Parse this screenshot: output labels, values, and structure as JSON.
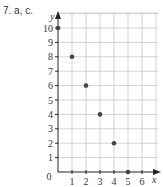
{
  "problem_label": "7. a, c.",
  "chart_data": {
    "type": "scatter",
    "title": "",
    "xlabel": "x",
    "ylabel": "y",
    "x": [
      0,
      1,
      2,
      3,
      4,
      5
    ],
    "y": [
      10,
      8,
      6,
      4,
      2,
      0
    ],
    "series": [
      {
        "name": "points",
        "x": [
          0,
          1,
          2,
          3,
          4,
          5
        ],
        "y": [
          10,
          8,
          6,
          4,
          2,
          0
        ]
      }
    ],
    "xlim": [
      0,
      7
    ],
    "ylim": [
      0,
      11
    ],
    "x_ticks": [
      "0",
      "1",
      "2",
      "3",
      "4",
      "5",
      "6"
    ],
    "y_ticks": [
      "1",
      "2",
      "3",
      "4",
      "5",
      "6",
      "7",
      "8",
      "9",
      "10"
    ],
    "grid": true,
    "legend": null,
    "colors": {
      "point": "#444444",
      "grid": "#c8c8c8",
      "axis": "#222222"
    }
  }
}
